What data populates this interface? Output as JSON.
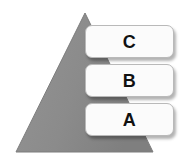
{
  "diagram": {
    "shape": {
      "name": "pyramid-triangle",
      "fill_color": "#8c8c8c",
      "stroke_color": "#7d7d7d",
      "apex": {
        "x": 85,
        "y": 13
      },
      "base_left": {
        "x": 16,
        "y": 152
      },
      "base_right": {
        "x": 153,
        "y": 152
      }
    },
    "box_style": {
      "fill_color": "#fbfbfb",
      "border_color": "#b9b9b9",
      "text_color": "#111111",
      "shadow_color": "#000000"
    },
    "levels": [
      {
        "id": "c",
        "label": "C",
        "tier": 3,
        "position": "top"
      },
      {
        "id": "b",
        "label": "B",
        "tier": 2,
        "position": "middle"
      },
      {
        "id": "a",
        "label": "A",
        "tier": 1,
        "position": "bottom"
      }
    ]
  }
}
